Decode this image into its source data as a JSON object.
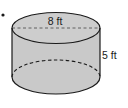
{
  "figure": {
    "shape": "cylinder",
    "diameter_label": "8 ft",
    "height_label": "5 ft",
    "bullet": "•",
    "colors": {
      "fill": "#c9c9c9",
      "stroke": "#1a1a1a",
      "background": "#ffffff"
    }
  }
}
